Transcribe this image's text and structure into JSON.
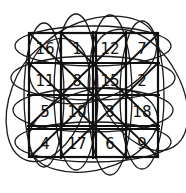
{
  "diagram": {
    "type": "hand-drawn magic-square grid with loops",
    "rows": 4,
    "cols": 4,
    "cells": [
      [
        "16",
        "1",
        "12",
        "7"
      ],
      [
        "11",
        "8",
        "15",
        "2"
      ],
      [
        "5",
        "10",
        "3",
        "18"
      ],
      [
        "4",
        "17",
        "6",
        "9"
      ]
    ],
    "stroke_color": "#111111",
    "background": "#ffffff"
  }
}
